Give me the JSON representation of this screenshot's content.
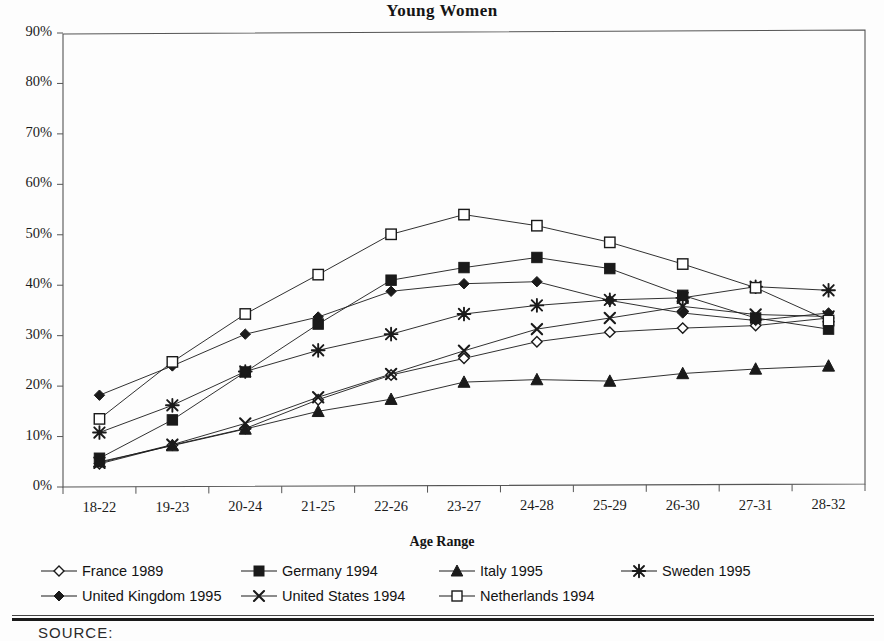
{
  "chart_data": {
    "type": "line",
    "title": "Young Women",
    "xlabel": "Age Range",
    "ylabel": "",
    "grid": false,
    "legend_position": "bottom",
    "ylim": [
      0,
      90
    ],
    "ytick_labels": [
      "90%",
      "80%",
      "70%",
      "60%",
      "50%",
      "40%",
      "30%",
      "20%",
      "10%",
      "0%"
    ],
    "ytick_values": [
      90,
      80,
      70,
      60,
      50,
      40,
      30,
      20,
      10,
      0
    ],
    "categories": [
      "18-22",
      "19-23",
      "20-24",
      "21-25",
      "22-26",
      "23-27",
      "24-28",
      "25-29",
      "26-30",
      "27-31",
      "28-32"
    ],
    "series": [
      {
        "name": "France 1989",
        "marker": "open-diamond",
        "values": [
          4.6,
          8.3,
          11.6,
          17.3,
          22.2,
          25.5,
          28.8,
          30.7,
          31.5,
          32.0,
          33.5
        ]
      },
      {
        "name": "Germany 1994",
        "marker": "filled-square",
        "values": [
          5.7,
          13.3,
          22.8,
          32.3,
          41.0,
          43.5,
          45.5,
          43.3,
          38.0,
          33.5,
          31.3
        ]
      },
      {
        "name": "Italy 1995",
        "marker": "filled-triangle",
        "values": [
          5.0,
          8.2,
          11.5,
          15.0,
          17.4,
          20.8,
          21.3,
          21.0,
          22.5,
          23.4,
          24.0
        ]
      },
      {
        "name": "Sweden 1995",
        "marker": "asterisk",
        "values": [
          10.8,
          16.2,
          22.9,
          27.1,
          30.3,
          34.3,
          36.0,
          37.1,
          37.5,
          39.7,
          39.0
        ]
      },
      {
        "name": "United Kingdom 1995",
        "marker": "filled-diamond",
        "values": [
          18.2,
          24.0,
          30.3,
          33.7,
          38.8,
          40.3,
          40.7,
          37.0,
          34.5,
          33.0,
          34.5
        ]
      },
      {
        "name": "United States 1994",
        "marker": "cross-x",
        "values": [
          4.8,
          8.4,
          12.6,
          17.8,
          22.4,
          27.0,
          31.3,
          33.5,
          35.8,
          34.2,
          33.8
        ]
      },
      {
        "name": "Netherlands 1994",
        "marker": "open-square",
        "values": [
          13.5,
          24.8,
          34.3,
          42.1,
          50.1,
          54.0,
          51.8,
          48.5,
          44.2,
          39.5,
          33.0
        ]
      }
    ]
  },
  "legend": {
    "rows": [
      [
        {
          "label": "France 1989",
          "marker": "open-diamond",
          "x": 10
        },
        {
          "label": "Germany 1994",
          "marker": "filled-square",
          "x": 210
        },
        {
          "label": "Italy 1995",
          "marker": "filled-triangle",
          "x": 408
        },
        {
          "label": "Sweden 1995",
          "marker": "asterisk",
          "x": 590
        }
      ],
      [
        {
          "label": "United Kingdom 1995",
          "marker": "filled-diamond",
          "x": 10
        },
        {
          "label": "United States 1994",
          "marker": "cross-x",
          "x": 210
        },
        {
          "label": "Netherlands 1994",
          "marker": "open-square",
          "x": 408
        }
      ]
    ]
  },
  "footer": {
    "source_text": "SOURCE:"
  },
  "colors": {
    "ink": "#1a1a1a",
    "axis": "#555555",
    "background": "#fdfdfd"
  }
}
